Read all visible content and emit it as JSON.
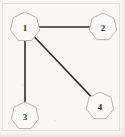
{
  "figure": {
    "type": "undirected-graph-diagram",
    "background_color": "#f8f7f5",
    "border_color": "#e4e2df",
    "edge_color": "#2e2e2e",
    "node_fill_color": "#fbfaf8",
    "node_stroke_color": "#b9b7b3",
    "label_color": "#2b2b2b",
    "node_shape": "heptagon"
  },
  "graph": {
    "nodes": [
      {
        "id": "1",
        "label": "1",
        "cx": 25,
        "cy": 27,
        "r": 15
      },
      {
        "id": "2",
        "label": "2",
        "cx": 103,
        "cy": 27,
        "r": 14
      },
      {
        "id": "3",
        "label": "3",
        "cx": 25,
        "cy": 116,
        "r": 14
      },
      {
        "id": "4",
        "label": "4",
        "cx": 100,
        "cy": 106,
        "r": 14
      }
    ],
    "edges": [
      {
        "id": "edge-1-2",
        "from": "1",
        "to": "2",
        "x1": 39,
        "y1": 27,
        "x2": 89,
        "y2": 27
      },
      {
        "id": "edge-1-3",
        "from": "1",
        "to": "3",
        "x1": 25,
        "y1": 41,
        "x2": 25,
        "y2": 102
      },
      {
        "id": "edge-1-4",
        "from": "1",
        "to": "4",
        "x1": 34,
        "y1": 38,
        "x2": 91,
        "y2": 96
      }
    ]
  }
}
